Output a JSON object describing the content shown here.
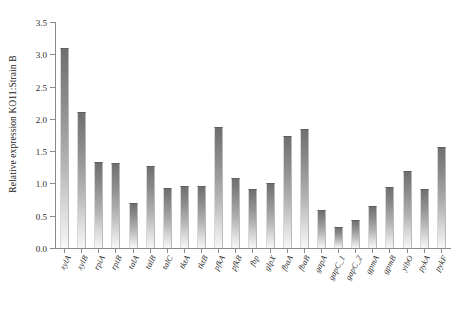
{
  "chart_data": {
    "type": "bar",
    "title": "",
    "subtitle": "",
    "xlabel": "",
    "ylabel": "Relative expression KO11:Strain B",
    "ylim": [
      0.0,
      3.5
    ],
    "ytick_labels": [
      "3.5",
      "3.0",
      "2.5",
      "2.0",
      "1.5",
      "1.0",
      "0.5",
      "0.0"
    ],
    "ytick_values": [
      3.5,
      3.0,
      2.5,
      2.0,
      1.5,
      1.0,
      0.5,
      0.0
    ],
    "grid": false,
    "legend": "none",
    "categories": [
      "xylA",
      "xylB",
      "rpiA",
      "rpiB",
      "talA",
      "talB",
      "talC",
      "tktA",
      "tktB",
      "pfkA",
      "pfkB",
      "fbp",
      "glpX",
      "fbaA",
      "fbaB",
      "gapA",
      "gapC_1",
      "gapC_2",
      "gpmA",
      "gpmB",
      "yibO",
      "pykA",
      "pykF"
    ],
    "values": [
      3.1,
      2.1,
      1.34,
      1.31,
      0.69,
      1.27,
      0.93,
      0.96,
      0.96,
      1.87,
      1.08,
      0.92,
      1.0,
      1.73,
      1.85,
      0.59,
      0.32,
      0.43,
      0.65,
      0.94,
      1.19,
      0.91,
      1.56
    ],
    "bar_color_top": "#6f6f6f",
    "bar_color_bottom": "#f7f7f7",
    "axis_color": "#8a8a8a",
    "background": "#ffffff"
  }
}
